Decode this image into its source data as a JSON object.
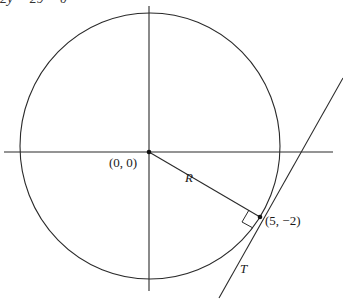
{
  "header_equation_fragment": "2y − 29 = 0",
  "diagram": {
    "labels": {
      "origin": "(0, 0)",
      "radius": "R",
      "tangent_point": "(5, −2)",
      "tangent_line": "T"
    },
    "geometry_data": {
      "circle_center": [
        0,
        0
      ],
      "tangent_point": [
        5,
        -2
      ],
      "right_angle_at_tangent_point": true
    },
    "colors": {
      "stroke": "#2a2a2a",
      "background": "#ffffff"
    }
  }
}
